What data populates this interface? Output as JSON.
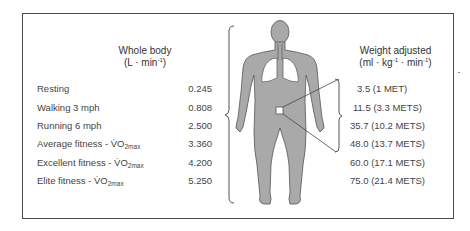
{
  "left_header": {
    "title": "Whole body",
    "unit_pre": "(L · min",
    "unit_sup": "-1",
    "unit_post": ")"
  },
  "right_header": {
    "title": "Weight adjusted",
    "unit_pre": "(ml · kg",
    "unit_sup1": "-1",
    "unit_mid": " · min",
    "unit_sup2": "-1",
    "unit_post": ")"
  },
  "rows": [
    {
      "label": "Resting",
      "label_sub": "",
      "whole_body": "0.245",
      "weight_adjusted": "3.5 (1 MET)"
    },
    {
      "label": "Walking 3 mph",
      "label_sub": "",
      "whole_body": "0.808",
      "weight_adjusted": "11.5 (3.3 METS)"
    },
    {
      "label": "Running 6 mph",
      "label_sub": "",
      "whole_body": "2.500",
      "weight_adjusted": "35.7 (10.2 METS)"
    },
    {
      "label": "Average fitness - V̇O",
      "label_sub": "2max",
      "whole_body": "3.360",
      "weight_adjusted": "48.0 (13.7 METS)"
    },
    {
      "label": "Excellent fitness - V̇O",
      "label_sub": "2max",
      "whole_body": "4.200",
      "weight_adjusted": "60.0 (17.1 METS)"
    },
    {
      "label": "Elite fitness - V̇O",
      "label_sub": "2max",
      "whole_body": "5.250",
      "weight_adjusted": "75.0 (21.4 METS)"
    }
  ],
  "figure": {
    "body_color": "#a9a9a9",
    "outline_color": "#555555"
  }
}
